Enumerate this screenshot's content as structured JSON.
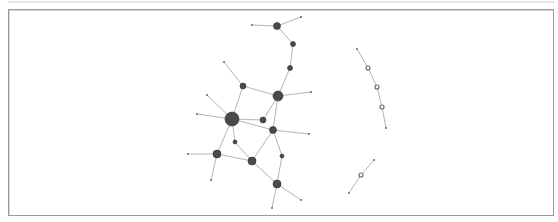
{
  "diagram": {
    "type": "network-graph",
    "colors": {
      "edge": "#b4b4b4",
      "node_fill": "#4a4a4a",
      "node_stroke": "#2e2e2e",
      "leaf": "#6a6a6a",
      "hollow_stroke": "#6e6e6e",
      "frame": "#9a9a9a"
    },
    "nodes": [
      {
        "id": "n1",
        "x": 277,
        "y": 26,
        "r": 3.5,
        "kind": "filled"
      },
      {
        "id": "l1",
        "x": 252,
        "y": 25,
        "r": 1,
        "kind": "leaf"
      },
      {
        "id": "l2",
        "x": 301,
        "y": 17,
        "r": 1,
        "kind": "leaf"
      },
      {
        "id": "n2",
        "x": 293,
        "y": 44,
        "r": 2.5,
        "kind": "filled"
      },
      {
        "id": "n3",
        "x": 290,
        "y": 68,
        "r": 2.5,
        "kind": "filled"
      },
      {
        "id": "n4",
        "x": 278,
        "y": 96,
        "r": 5,
        "kind": "filled"
      },
      {
        "id": "l3",
        "x": 311,
        "y": 92,
        "r": 1,
        "kind": "leaf"
      },
      {
        "id": "n5",
        "x": 243,
        "y": 86,
        "r": 3,
        "kind": "filled"
      },
      {
        "id": "l4",
        "x": 224,
        "y": 62,
        "r": 1,
        "kind": "leaf"
      },
      {
        "id": "l5",
        "x": 207,
        "y": 95,
        "r": 1,
        "kind": "leaf"
      },
      {
        "id": "n6",
        "x": 232,
        "y": 119,
        "r": 7,
        "kind": "filled"
      },
      {
        "id": "l6",
        "x": 197,
        "y": 114,
        "r": 1,
        "kind": "leaf"
      },
      {
        "id": "n7",
        "x": 263,
        "y": 120,
        "r": 3,
        "kind": "filled"
      },
      {
        "id": "n8",
        "x": 273,
        "y": 130,
        "r": 3.5,
        "kind": "filled"
      },
      {
        "id": "l7",
        "x": 309,
        "y": 134,
        "r": 1,
        "kind": "leaf"
      },
      {
        "id": "n9",
        "x": 235,
        "y": 142,
        "r": 2,
        "kind": "filled"
      },
      {
        "id": "n10",
        "x": 217,
        "y": 154,
        "r": 4,
        "kind": "filled"
      },
      {
        "id": "l8",
        "x": 188,
        "y": 154,
        "r": 1,
        "kind": "leaf"
      },
      {
        "id": "l9",
        "x": 211,
        "y": 180,
        "r": 1,
        "kind": "leaf"
      },
      {
        "id": "n11",
        "x": 252,
        "y": 161,
        "r": 4,
        "kind": "filled"
      },
      {
        "id": "n12",
        "x": 282,
        "y": 156,
        "r": 2,
        "kind": "filled"
      },
      {
        "id": "n13",
        "x": 277,
        "y": 184,
        "r": 4,
        "kind": "filled"
      },
      {
        "id": "l10",
        "x": 301,
        "y": 200,
        "r": 1,
        "kind": "leaf"
      },
      {
        "id": "l11",
        "x": 272,
        "y": 208,
        "r": 1,
        "kind": "leaf"
      },
      {
        "id": "c1",
        "x": 357,
        "y": 49,
        "r": 1,
        "kind": "leaf"
      },
      {
        "id": "h1",
        "x": 368,
        "y": 68,
        "r": 2,
        "kind": "hollow"
      },
      {
        "id": "h2",
        "x": 377,
        "y": 87,
        "r": 2,
        "kind": "hollow"
      },
      {
        "id": "h3",
        "x": 382,
        "y": 107,
        "r": 2,
        "kind": "hollow"
      },
      {
        "id": "c2",
        "x": 386,
        "y": 128,
        "r": 1,
        "kind": "leaf"
      },
      {
        "id": "d1",
        "x": 374,
        "y": 160,
        "r": 1,
        "kind": "leaf"
      },
      {
        "id": "h4",
        "x": 361,
        "y": 175,
        "r": 2,
        "kind": "hollow"
      },
      {
        "id": "d2",
        "x": 349,
        "y": 193,
        "r": 1,
        "kind": "leaf"
      }
    ],
    "edges": [
      [
        "l1",
        "n1"
      ],
      [
        "n1",
        "l2"
      ],
      [
        "n1",
        "n2"
      ],
      [
        "n2",
        "n3"
      ],
      [
        "n3",
        "n4"
      ],
      [
        "n4",
        "l3"
      ],
      [
        "n5",
        "n4"
      ],
      [
        "l4",
        "n5"
      ],
      [
        "n5",
        "n6"
      ],
      [
        "l5",
        "n6"
      ],
      [
        "l6",
        "n6"
      ],
      [
        "n6",
        "n7"
      ],
      [
        "n6",
        "n8"
      ],
      [
        "n6",
        "n9"
      ],
      [
        "n6",
        "n10"
      ],
      [
        "n4",
        "n7"
      ],
      [
        "n4",
        "n8"
      ],
      [
        "n8",
        "l7"
      ],
      [
        "n8",
        "n11"
      ],
      [
        "n8",
        "n12"
      ],
      [
        "n9",
        "n11"
      ],
      [
        "n10",
        "n11"
      ],
      [
        "l8",
        "n10"
      ],
      [
        "n10",
        "l9"
      ],
      [
        "n11",
        "n13"
      ],
      [
        "n12",
        "n13"
      ],
      [
        "n13",
        "l10"
      ],
      [
        "n13",
        "l11"
      ],
      [
        "c1",
        "h1"
      ],
      [
        "h1",
        "h2"
      ],
      [
        "h2",
        "h3"
      ],
      [
        "h3",
        "c2"
      ],
      [
        "d1",
        "h4"
      ],
      [
        "h4",
        "d2"
      ]
    ]
  }
}
